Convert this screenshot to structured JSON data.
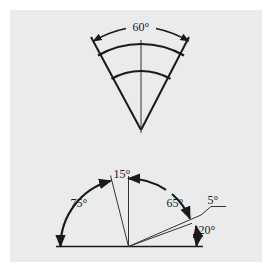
{
  "diagram": {
    "type": "angular-dimensioning-figure",
    "background_color": "#ebebeb",
    "line_color": "#1a1a1a",
    "top_figure": {
      "name": "sector-with-60-degree-dimension",
      "angle_label": "60°",
      "angle_degrees": 60,
      "arc_count": 2,
      "has_centerline": true
    },
    "bottom_figure": {
      "name": "semicircle-angle-dimensions",
      "labels": {
        "a75": "75°",
        "a15": "15°",
        "a65": "65°",
        "a5": "5°",
        "a20": "20°"
      },
      "angles_degrees": [
        75,
        15,
        65,
        5,
        20
      ]
    }
  }
}
